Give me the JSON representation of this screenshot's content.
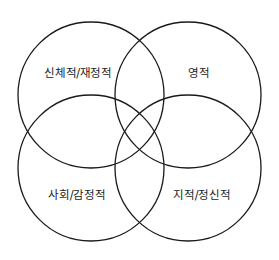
{
  "diagram": {
    "type": "venn",
    "stroke_color": "#1a1a1a",
    "circles": [
      {
        "name": "physical-financial",
        "label": "신체적/재정적",
        "cx": 91,
        "cy": 95,
        "r": 73,
        "label_x": 78,
        "label_y": 72
      },
      {
        "name": "spiritual",
        "label": "영적",
        "cx": 188,
        "cy": 95,
        "r": 73,
        "label_x": 199,
        "label_y": 72
      },
      {
        "name": "social-emotional",
        "label": "사회/감정적",
        "cx": 91,
        "cy": 168,
        "r": 73,
        "label_x": 77,
        "label_y": 194
      },
      {
        "name": "intellectual-mental",
        "label": "지적/정신적",
        "cx": 188,
        "cy": 168,
        "r": 73,
        "label_x": 202,
        "label_y": 194
      }
    ]
  }
}
